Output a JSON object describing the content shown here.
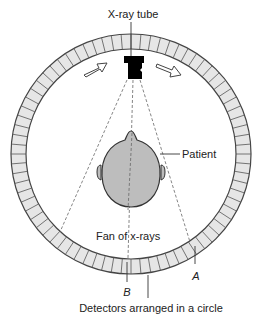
{
  "diagram": {
    "labels": {
      "tube": "X-ray tube",
      "patient": "Patient",
      "fan": "Fan of x-rays",
      "point_a": "A",
      "point_b": "B",
      "detectors": "Detectors arranged in a circle"
    },
    "ring": {
      "center": [
        131,
        154
      ],
      "outer_radius": 120,
      "inner_radius": 105,
      "segments": 76,
      "fill": "#e6e6e6",
      "stroke": "#444444"
    },
    "colors": {
      "head_fill": "#bdbdbd",
      "tube_fill": "#000000",
      "line": "#444444"
    },
    "arrows": [
      {
        "name": "rotation-arrow-left",
        "direction": "up-right"
      },
      {
        "name": "rotation-arrow-right",
        "direction": "down-right"
      }
    ]
  }
}
